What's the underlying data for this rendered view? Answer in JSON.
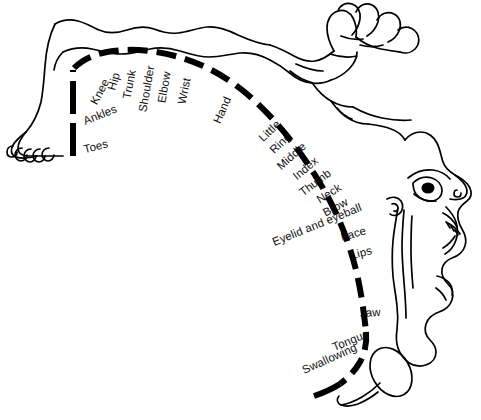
{
  "diagram": {
    "colors": {
      "outline": "#000000",
      "strip": "#000000",
      "label_text": "#111111",
      "background": "#ffffff"
    },
    "strip": {
      "style": "dashed",
      "thickness_px": 6
    },
    "labels": [
      {
        "id": "toes",
        "text": "Toes",
        "x": 84,
        "y": 150,
        "rotate": -14,
        "size": 11.5
      },
      {
        "id": "ankles",
        "text": "Ankles",
        "x": 84,
        "y": 122,
        "rotate": -22,
        "size": 11.5
      },
      {
        "id": "knee",
        "text": "Knee",
        "x": 94,
        "y": 104,
        "rotate": -62,
        "size": 11.5
      },
      {
        "id": "hip",
        "text": "Hip",
        "x": 112,
        "y": 90,
        "rotate": -74,
        "size": 11.5
      },
      {
        "id": "trunk",
        "text": "Trunk",
        "x": 127,
        "y": 99,
        "rotate": -79,
        "size": 11.5
      },
      {
        "id": "shoulder",
        "text": "Shoulder",
        "x": 143,
        "y": 112,
        "rotate": -80,
        "size": 11.5
      },
      {
        "id": "elbow",
        "text": "Elbow",
        "x": 162,
        "y": 103,
        "rotate": -80,
        "size": 11.5
      },
      {
        "id": "wrist",
        "text": "Wrist",
        "x": 182,
        "y": 104,
        "rotate": -78,
        "size": 11.5
      },
      {
        "id": "hand",
        "text": "Hand",
        "x": 217,
        "y": 123,
        "rotate": -66,
        "size": 11.5
      },
      {
        "id": "little",
        "text": "Little",
        "x": 261,
        "y": 140,
        "rotate": -44,
        "size": 11.5
      },
      {
        "id": "ring",
        "text": "Ring",
        "x": 272,
        "y": 152,
        "rotate": -44,
        "size": 11.5
      },
      {
        "id": "middle",
        "text": "Middle",
        "x": 279,
        "y": 168,
        "rotate": -42,
        "size": 11.5
      },
      {
        "id": "index",
        "text": "Index",
        "x": 295,
        "y": 178,
        "rotate": -40,
        "size": 11.5
      },
      {
        "id": "thumb",
        "text": "Thumb",
        "x": 301,
        "y": 194,
        "rotate": -37,
        "size": 11.5
      },
      {
        "id": "neck",
        "text": "Neck",
        "x": 318,
        "y": 201,
        "rotate": -32,
        "size": 11.5
      },
      {
        "id": "brow",
        "text": "Brow",
        "x": 324,
        "y": 214,
        "rotate": -28,
        "size": 11.5
      },
      {
        "id": "eyelid-and-eyeball",
        "text": "Eyelid and eyeball",
        "x": 273,
        "y": 243,
        "rotate": -22,
        "size": 11.5
      },
      {
        "id": "face",
        "text": "Face",
        "x": 341,
        "y": 238,
        "rotate": -16,
        "size": 11.5
      },
      {
        "id": "lips",
        "text": "Lips",
        "x": 351,
        "y": 256,
        "rotate": -14,
        "size": 11.5
      },
      {
        "id": "jaw",
        "text": "Jaw",
        "x": 360,
        "y": 314,
        "rotate": -4,
        "size": 11.5
      },
      {
        "id": "tongue",
        "text": "Tongue",
        "x": 333,
        "y": 348,
        "rotate": -22,
        "size": 11.5
      },
      {
        "id": "swallowing",
        "text": "Swallowing",
        "x": 303,
        "y": 371,
        "rotate": -24,
        "size": 11.5
      }
    ]
  }
}
